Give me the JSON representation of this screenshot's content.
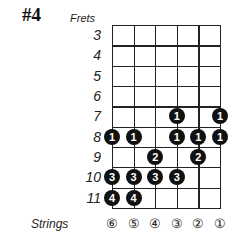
{
  "title": "#4",
  "frets_label": "Frets",
  "strings_label": "Strings",
  "frets": [
    "3",
    "4",
    "5",
    "6",
    "7",
    "8",
    "9",
    "10",
    "11"
  ],
  "strings": [
    "⑥",
    "⑤",
    "④",
    "③",
    "②",
    "①"
  ],
  "colors": {
    "dot": "#111111",
    "dot_text": "#ffffff",
    "line": "#222222"
  },
  "dots": [
    {
      "fret": 7,
      "string_index": 3,
      "finger": "1"
    },
    {
      "fret": 7,
      "string_index": 5,
      "finger": "1"
    },
    {
      "fret": 8,
      "string_index": 0,
      "finger": "1"
    },
    {
      "fret": 8,
      "string_index": 1,
      "finger": "1"
    },
    {
      "fret": 8,
      "string_index": 3,
      "finger": "1"
    },
    {
      "fret": 8,
      "string_index": 4,
      "finger": "1"
    },
    {
      "fret": 8,
      "string_index": 5,
      "finger": "1"
    },
    {
      "fret": 9,
      "string_index": 2,
      "finger": "2"
    },
    {
      "fret": 9,
      "string_index": 4,
      "finger": "2"
    },
    {
      "fret": 10,
      "string_index": 0,
      "finger": "3"
    },
    {
      "fret": 10,
      "string_index": 1,
      "finger": "3"
    },
    {
      "fret": 10,
      "string_index": 2,
      "finger": "3"
    },
    {
      "fret": 10,
      "string_index": 3,
      "finger": "3"
    },
    {
      "fret": 11,
      "string_index": 0,
      "finger": "4"
    },
    {
      "fret": 11,
      "string_index": 1,
      "finger": "4"
    }
  ]
}
